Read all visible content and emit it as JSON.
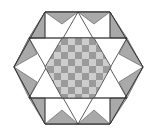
{
  "figure": {
    "colors": {
      "background": "#ffffff",
      "outline": "#333333",
      "gray_triangle": "#a9a9a9",
      "white_region": "#ffffff",
      "checker_dark": "#9a9a9a",
      "checker_light": "#cdcdcd"
    },
    "outer_hexagon": [
      [
        45,
        12
      ],
      [
        110,
        12
      ],
      [
        143,
        67
      ],
      [
        110,
        124
      ],
      [
        45,
        124
      ],
      [
        14,
        67
      ]
    ],
    "star_up_triangle": [
      [
        78,
        12
      ],
      [
        127,
        98
      ],
      [
        29,
        98
      ]
    ],
    "star_down_triangle": [
      [
        78,
        124
      ],
      [
        127,
        38
      ],
      [
        29,
        38
      ]
    ],
    "checker_size": 7
  }
}
